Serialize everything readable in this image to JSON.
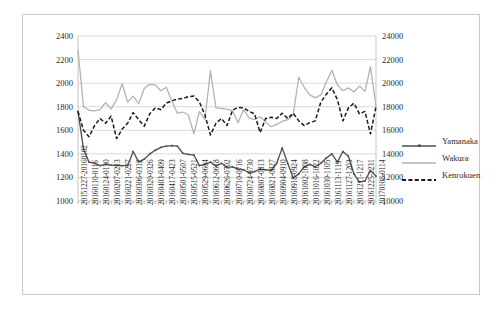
{
  "chart_data": {
    "type": "line",
    "title": "",
    "xlabel": "",
    "ylabel": "",
    "ylim": [
      1000,
      2400
    ],
    "y2lim": [
      10000,
      24000
    ],
    "grid": true,
    "legend_position": "right",
    "left_axis_ticks": [
      1000,
      1200,
      1400,
      1600,
      1800,
      2000,
      2200,
      2400
    ],
    "right_axis_ticks": [
      10000,
      12000,
      14000,
      16000,
      18000,
      20000,
      22000,
      24000
    ],
    "categories": [
      "20151227-20160102",
      "20160103-0109",
      "20160110-0116",
      "20160117-0123",
      "20160124-0130",
      "20160131-0206",
      "20160207-0213",
      "20160214-0220",
      "20160221-0227",
      "20160228-0305",
      "20160306-0312",
      "20160313-0319",
      "20160320-0326",
      "20160327-0402",
      "20160403-0409",
      "20160410-0416",
      "20160417-0423",
      "20160424-0430",
      "20160501-0507",
      "20160508-0514",
      "20160515-0521",
      "20160522-0528",
      "20160529-0604",
      "20160605-0611",
      "20160612-0618",
      "20160619-0625",
      "20160626-0702",
      "20160703-0709",
      "20160710-0716",
      "20160717-0723",
      "20160724-0730",
      "20160731-0806",
      "20160807-0813",
      "20160814-0820",
      "20160821-0827",
      "20160828-0903",
      "20160904-0910",
      "20160911-0917",
      "20160918-0924",
      "20160925-1001",
      "20161002-1008",
      "20161009-1015",
      "20161016-1022",
      "20161023-1029",
      "20161030-1105",
      "20161106-1112",
      "20161113-1119",
      "20161120-1126",
      "20161127-1203",
      "20161204-1210",
      "20161211-1217",
      "20161218-1224",
      "20161225-1231",
      "20170101-0107",
      "20170108-0114"
    ],
    "visible_tick_labels": [
      "20151227-20160102",
      "20160110-0116",
      "20160124-0130",
      "20160207-0213",
      "20160221-0227",
      "20160306-0312",
      "20160320-0326",
      "20160403-0409",
      "20160417-0423",
      "20160501-0507",
      "20160515-0521",
      "20160529-0604",
      "20160612-0618",
      "20160626-0702",
      "20160710-0716",
      "20160724-0730",
      "20160807-0813",
      "20160821-0827",
      "20160904-0910",
      "20160918-0924",
      "20161002-1008",
      "20161016-1022",
      "20161030-1105",
      "20161113-1119",
      "20161127-1203",
      "20161211-1217",
      "20161225-1231",
      "20170108-0114"
    ],
    "series": [
      {
        "name": "Yamanaka",
        "axis": "left",
        "color": "#4d4d4d",
        "style": "solid-marker",
        "values": [
          1760,
          1440,
          1330,
          1320,
          1300,
          1310,
          1305,
          1300,
          1300,
          1300,
          1420,
          1330,
          1355,
          1400,
          1430,
          1455,
          1465,
          1470,
          1465,
          1405,
          1395,
          1390,
          1300,
          1310,
          1330,
          1295,
          1320,
          1285,
          1290,
          1270,
          1265,
          1240,
          1250,
          1270,
          1265,
          1260,
          1320,
          1450,
          1320,
          1195,
          1230,
          1290,
          1310,
          1290,
          1320,
          1365,
          1400,
          1330,
          1420,
          1380,
          1230,
          1160,
          1170,
          1260,
          1210
        ]
      },
      {
        "name": "Wakura",
        "axis": "right",
        "color": "#b3b3b3",
        "style": "solid",
        "values": [
          22800,
          18000,
          17700,
          17650,
          17750,
          18350,
          17800,
          18600,
          19950,
          18400,
          18900,
          18250,
          19550,
          19900,
          19850,
          19350,
          19650,
          18500,
          17450,
          17550,
          17300,
          15700,
          17600,
          16900,
          21050,
          17900,
          17850,
          17800,
          17650,
          16650,
          17750,
          17050,
          16900,
          17150,
          16700,
          16300,
          16500,
          16750,
          16900,
          17300,
          20500,
          19650,
          19000,
          18750,
          19000,
          20100,
          21100,
          19850,
          19350,
          19600,
          19250,
          19750,
          19300,
          21400,
          18000
        ]
      },
      {
        "name": "Kenrokuen",
        "axis": "left",
        "color": "#1a1a1a",
        "style": "dashed",
        "values": [
          1760,
          1600,
          1545,
          1640,
          1700,
          1660,
          1720,
          1530,
          1610,
          1660,
          1750,
          1690,
          1635,
          1740,
          1790,
          1775,
          1830,
          1850,
          1865,
          1870,
          1885,
          1890,
          1840,
          1730,
          1560,
          1660,
          1700,
          1640,
          1770,
          1795,
          1790,
          1760,
          1740,
          1580,
          1700,
          1710,
          1700,
          1745,
          1700,
          1745,
          1680,
          1640,
          1665,
          1680,
          1840,
          1905,
          1960,
          1860,
          1680,
          1790,
          1830,
          1740,
          1760,
          1570,
          1800
        ]
      }
    ]
  },
  "legend": {
    "items": [
      {
        "label": "Yamanaka"
      },
      {
        "label": "Wakura"
      },
      {
        "label": "Kenrokuen"
      }
    ]
  }
}
